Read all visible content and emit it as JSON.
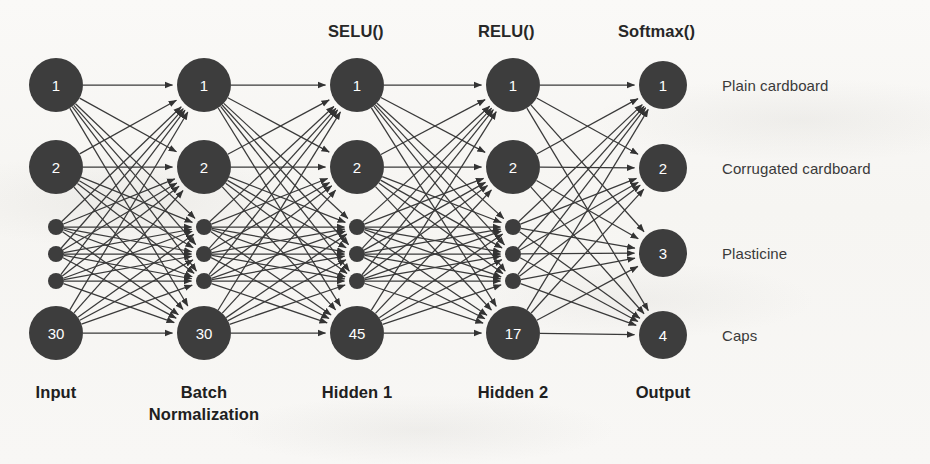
{
  "diagram": {
    "background_color": "#f8f7f5",
    "node_fill": "#3d3d3d",
    "node_text_color": "#ffffff",
    "edge_color": "#3a3a3a"
  },
  "activation_labels": [
    {
      "text": "SELU()",
      "x": 328,
      "y": 22
    },
    {
      "text": "RELU()",
      "x": 478,
      "y": 22
    },
    {
      "text": "Softmax()",
      "x": 618,
      "y": 22
    }
  ],
  "layer_labels": [
    {
      "text": "Input",
      "center_x": 56,
      "y": 382
    },
    {
      "text": "Batch\nNormalization",
      "center_x": 204,
      "y": 382
    },
    {
      "text": "Hidden 1",
      "center_x": 357,
      "y": 382
    },
    {
      "text": "Hidden 2",
      "center_x": 513,
      "y": 382
    },
    {
      "text": "Output",
      "center_x": 663,
      "y": 382
    }
  ],
  "layer_label_line1": [
    "Input",
    "Batch",
    "Hidden 1",
    "Hidden 2",
    "Output"
  ],
  "layer_label_line2": [
    "",
    "Normalization",
    "",
    "",
    ""
  ],
  "class_labels": [
    {
      "text": "Plain cardboard",
      "x": 722,
      "y": 85
    },
    {
      "text": "Corrugated cardboard",
      "x": 722,
      "y": 168
    },
    {
      "text": "Plasticine",
      "x": 722,
      "y": 253
    },
    {
      "text": "Caps",
      "x": 722,
      "y": 335
    }
  ],
  "layers": [
    {
      "name": "Input",
      "x": 56,
      "node_radius": 27,
      "nodes": [
        {
          "label": "1",
          "y": 85,
          "kind": "circle"
        },
        {
          "label": "2",
          "y": 167,
          "kind": "circle"
        },
        {
          "label": "",
          "y": 227,
          "kind": "dot"
        },
        {
          "label": "",
          "y": 254,
          "kind": "dot"
        },
        {
          "label": "",
          "y": 281,
          "kind": "dot"
        },
        {
          "label": "30",
          "y": 333,
          "kind": "circle"
        }
      ]
    },
    {
      "name": "Batch Normalization",
      "x": 204,
      "node_radius": 27,
      "nodes": [
        {
          "label": "1",
          "y": 85,
          "kind": "circle"
        },
        {
          "label": "2",
          "y": 167,
          "kind": "circle"
        },
        {
          "label": "",
          "y": 227,
          "kind": "dot"
        },
        {
          "label": "",
          "y": 254,
          "kind": "dot"
        },
        {
          "label": "",
          "y": 281,
          "kind": "dot"
        },
        {
          "label": "30",
          "y": 333,
          "kind": "circle"
        }
      ]
    },
    {
      "name": "Hidden 1",
      "x": 357,
      "node_radius": 27,
      "nodes": [
        {
          "label": "1",
          "y": 85,
          "kind": "circle"
        },
        {
          "label": "2",
          "y": 167,
          "kind": "circle"
        },
        {
          "label": "",
          "y": 227,
          "kind": "dot"
        },
        {
          "label": "",
          "y": 254,
          "kind": "dot"
        },
        {
          "label": "",
          "y": 281,
          "kind": "dot"
        },
        {
          "label": "45",
          "y": 333,
          "kind": "circle"
        }
      ]
    },
    {
      "name": "Hidden 2",
      "x": 513,
      "node_radius": 27,
      "nodes": [
        {
          "label": "1",
          "y": 85,
          "kind": "circle"
        },
        {
          "label": "2",
          "y": 167,
          "kind": "circle"
        },
        {
          "label": "",
          "y": 227,
          "kind": "dot"
        },
        {
          "label": "",
          "y": 254,
          "kind": "dot"
        },
        {
          "label": "",
          "y": 281,
          "kind": "dot"
        },
        {
          "label": "17",
          "y": 333,
          "kind": "circle"
        }
      ]
    },
    {
      "name": "Output",
      "x": 663,
      "node_radius": 24,
      "nodes": [
        {
          "label": "1",
          "y": 85,
          "kind": "circle"
        },
        {
          "label": "2",
          "y": 168,
          "kind": "circle"
        },
        {
          "label": "3",
          "y": 253,
          "kind": "circle"
        },
        {
          "label": "4",
          "y": 335,
          "kind": "circle"
        }
      ]
    }
  ],
  "connections": {
    "description": "Fully connected between consecutive layers; each source node connects to every target node",
    "style": "arrow",
    "pairs": [
      [
        0,
        1
      ],
      [
        1,
        2
      ],
      [
        2,
        3
      ],
      [
        3,
        4
      ]
    ]
  }
}
